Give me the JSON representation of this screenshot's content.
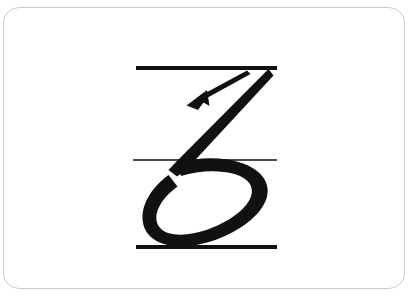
{
  "card": {
    "background_color": "#ffffff",
    "border_color": "#c9c9c9",
    "corner_radius_px": 16
  },
  "page": {
    "background_color": "#ffffff",
    "width_px": 411,
    "height_px": 300
  },
  "worksheet": {
    "title": "Cursive letter z handwriting guide",
    "letter": "z",
    "letter_case": "lowercase",
    "script_style": "cursive",
    "stroke_color": "#111111",
    "stroke_count": 1,
    "arrow_count": 1,
    "guide_lines": [
      {
        "name": "top-line",
        "role": "ascender-line",
        "weight": "thick",
        "thickness_px": 4,
        "y_px": 68,
        "x_start_px": 136,
        "x_end_px": 277,
        "color": "#111111"
      },
      {
        "name": "middle-line",
        "role": "midline",
        "weight": "thin",
        "thickness_px": 1.5,
        "y_px": 160,
        "x_start_px": 133,
        "x_end_px": 277,
        "color": "#111111"
      },
      {
        "name": "bottom-line",
        "role": "baseline",
        "weight": "thick",
        "thickness_px": 4,
        "y_px": 247,
        "x_start_px": 136,
        "x_end_px": 277,
        "color": "#111111"
      }
    ],
    "letter_stroke": {
      "name": "z-stroke",
      "description": "diagonal downstroke from the top line into a large open loop that closes on the baseline",
      "start_point_px": [
        268,
        70
      ],
      "end_point_px": [
        267,
        215
      ],
      "stroke_width_px": 13
    },
    "direction_arrow": {
      "name": "stroke-direction-arrow",
      "description": "thin arrow parallel to the diagonal downstroke indicating top-right to bottom-left motion",
      "tail_point_px": [
        248,
        72
      ],
      "tip_point_px": [
        188,
        104
      ],
      "shaft_width_px": 3,
      "head_length_px": 17,
      "head_width_px": 13,
      "color": "#111111"
    }
  }
}
